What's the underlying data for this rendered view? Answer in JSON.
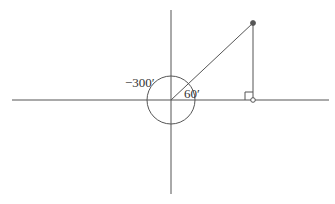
{
  "diagram": {
    "type": "angle-unit-circle",
    "labels": {
      "negative_angle": "−300′",
      "positive_angle": "60′"
    },
    "angles": {
      "positive_deg": 60,
      "negative_deg": -300
    },
    "colors": {
      "stroke": "#555555",
      "point_fill": "#555555",
      "background": "#ffffff"
    },
    "elements": {
      "x_axis": "horizontal-axis",
      "y_axis": "vertical-axis",
      "terminal_ray": "terminal-side-ray",
      "perpendicular": "perpendicular-drop-line",
      "right_angle": "right-angle-marker",
      "circle": "angle-arc-circle",
      "terminal_point": "filled-point",
      "foot_point": "open-point"
    }
  }
}
